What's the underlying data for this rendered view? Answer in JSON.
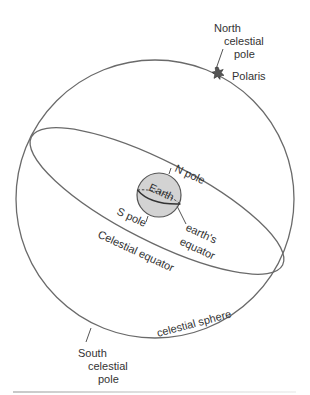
{
  "diagram": {
    "title": "Celestial sphere",
    "labels": {
      "north_celestial_pole": [
        "North",
        "celestial",
        "pole"
      ],
      "polaris": "Polaris",
      "n_pole": "N pole",
      "earth": "Earth",
      "s_pole": "S pole",
      "earths_equator": [
        "earth's",
        "equator"
      ],
      "celestial_equator": "Celestial equator",
      "celestial_sphere": "celestial sphere",
      "south_celestial_pole": [
        "South",
        "celestial",
        "pole"
      ]
    },
    "colors": {
      "lines": "#6a6a6a",
      "earth_fill": "#d3d3d3",
      "star_fill": "#555555",
      "text": "#333333"
    }
  }
}
